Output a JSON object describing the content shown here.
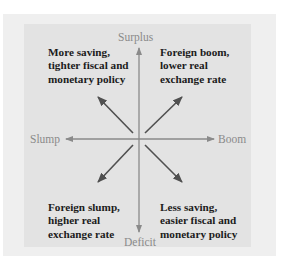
{
  "diagram": {
    "axes": {
      "top": "Surplus",
      "bottom": "Deficit",
      "left": "Slump",
      "right": "Boom"
    },
    "quadrants": {
      "top_left": [
        "More saving,",
        "tighter fiscal and",
        "monetary policy"
      ],
      "top_right": [
        "Foreign boom,",
        "lower real",
        "exchange rate"
      ],
      "bottom_left": [
        "Foreign slump,",
        "higher real",
        "exchange rate"
      ],
      "bottom_right": [
        "Less saving,",
        "easier fiscal and",
        "monetary policy"
      ]
    },
    "colors": {
      "outer_frame": "#efefef",
      "inner_panel": "#e3e3e3",
      "axis": "#8a8a8a",
      "diagonal_arrows": "#505050",
      "text": "#1c1c1c"
    }
  }
}
